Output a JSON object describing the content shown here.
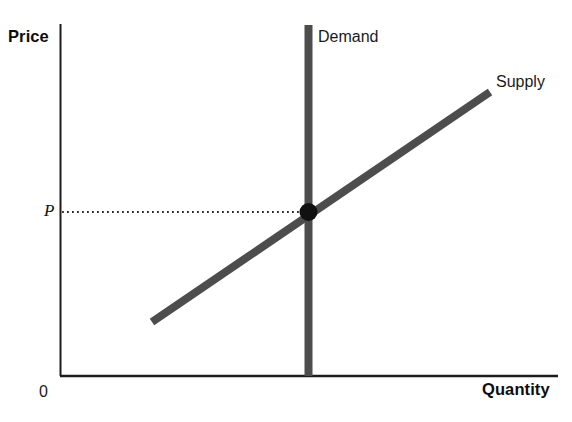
{
  "figure": {
    "background_color": "#ffffff"
  },
  "axes": {
    "y_label": "Price",
    "x_label": "Quantity",
    "origin_label": "0",
    "axis_color": "#1c1c1c"
  },
  "annotations": {
    "demand_label": "Demand",
    "supply_label": "Supply",
    "equilibrium_price_label": "P"
  },
  "colors": {
    "curve": "#4d4d4d",
    "equilibrium_dot": "#111111",
    "guide_line": "#2b2b2b",
    "axis": "#1c1c1c"
  },
  "chart_data": {
    "type": "line",
    "xlabel": "Quantity",
    "ylabel": "Price",
    "grid": false,
    "legend": "inline-curve-labels",
    "axis_pixel_frame": {
      "x_axis_y": 376,
      "y_axis_x": 60,
      "x_axis_end": 558,
      "y_axis_top": 24
    },
    "series": [
      {
        "name": "Supply",
        "type": "line",
        "shape": "upward-sloping",
        "label": "Supply",
        "points": [
          {
            "x": 152,
            "y": 322
          },
          {
            "x": 490,
            "y": 92
          }
        ],
        "stroke_width": 8,
        "color": "#4d4d4d"
      },
      {
        "name": "Demand",
        "type": "line",
        "shape": "vertical",
        "label": "Demand",
        "points": [
          {
            "x": 308,
            "y": 25
          },
          {
            "x": 308,
            "y": 376
          }
        ],
        "stroke_width": 8,
        "color": "#4d4d4d"
      }
    ],
    "points": [
      {
        "name": "equilibrium",
        "x": 308,
        "y": 212,
        "radius": 9,
        "color": "#111111",
        "price_label": "P"
      }
    ],
    "guides": [
      {
        "name": "equilibrium-price-guide",
        "style": "dotted",
        "from": {
          "x": 62,
          "y": 212
        },
        "to": {
          "x": 304,
          "y": 212
        },
        "color": "#2b2b2b"
      }
    ]
  }
}
